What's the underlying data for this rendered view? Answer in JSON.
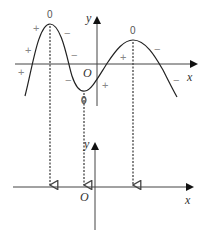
{
  "upper_graph": {
    "axis_labels": {
      "x": "x",
      "y": "y",
      "origin": "O"
    },
    "extrema_labels": [
      {
        "label": "0",
        "x": 50,
        "y": 18
      },
      {
        "label": "0",
        "x": 84,
        "y": 104
      },
      {
        "label": "0",
        "x": 133,
        "y": 34
      }
    ],
    "signs": [
      {
        "text": "+",
        "x": 36,
        "y": 32
      },
      {
        "text": "+",
        "x": 28,
        "y": 54
      },
      {
        "text": "+",
        "x": 21,
        "y": 76
      },
      {
        "text": "−",
        "x": 67,
        "y": 37
      },
      {
        "text": "−",
        "x": 74,
        "y": 59
      },
      {
        "text": "−",
        "x": 68,
        "y": 84
      },
      {
        "text": "+",
        "x": 105,
        "y": 89
      },
      {
        "text": "+",
        "x": 123,
        "y": 61
      },
      {
        "text": "−",
        "x": 157,
        "y": 53
      },
      {
        "text": "−",
        "x": 176,
        "y": 84
      }
    ]
  },
  "lower_graph": {
    "axis_labels": {
      "x": "x",
      "y": "y",
      "origin": "O"
    }
  },
  "projection_arrows": [
    {
      "from": "maximum",
      "x": 50
    },
    {
      "from": "minimum",
      "x": 84
    },
    {
      "from": "maximum",
      "x": 133
    }
  ],
  "colors": {
    "stroke": "#333333",
    "dashed": "#555555",
    "sign": "#888888"
  }
}
